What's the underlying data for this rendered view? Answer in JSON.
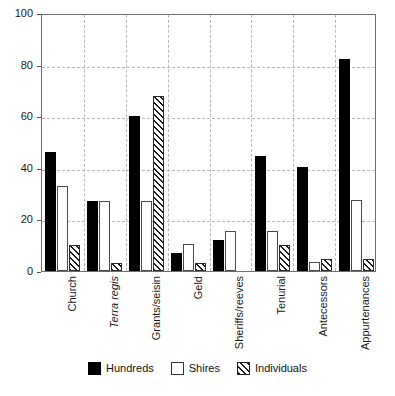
{
  "chart_data": {
    "type": "bar",
    "title": "",
    "subtitle": "",
    "xlabel": "",
    "ylabel": "",
    "ylim": [
      0,
      100
    ],
    "yticks": [
      0,
      20,
      40,
      60,
      80,
      100
    ],
    "grid": "dashed horizontal gridlines at y-ticks; dashed vertical separators between category groups",
    "legend_position": "bottom-center",
    "categories": [
      "Church",
      "Terra regis",
      "Grants/seisin",
      "Geld",
      "Sheriffs/reeves",
      "Tenurial",
      "Antecessors",
      "Appurtenances"
    ],
    "categories_italic": [
      false,
      true,
      false,
      false,
      false,
      false,
      false,
      false
    ],
    "series": [
      {
        "name": "Hundreds",
        "fill": "solid-black",
        "color": "#000000",
        "values": [
          46,
          27,
          60,
          7,
          12,
          44.5,
          40.5,
          82
        ]
      },
      {
        "name": "Shires",
        "fill": "white-outline",
        "color": "#ffffff",
        "values": [
          33,
          27,
          27,
          10.5,
          15.5,
          15.5,
          3.5,
          27.5
        ]
      },
      {
        "name": "Individuals",
        "fill": "diagonal-hatch",
        "color": "#1a1a1a",
        "values": [
          10,
          3,
          68,
          3,
          0,
          10,
          4.5,
          4.5
        ]
      }
    ]
  },
  "legend": {
    "items": [
      {
        "label": "Hundreds",
        "swatch": "solid-black-swatch"
      },
      {
        "label": "Shires",
        "swatch": "white-outline-swatch"
      },
      {
        "label": "Individuals",
        "swatch": "diagonal-hatch-swatch"
      }
    ]
  }
}
